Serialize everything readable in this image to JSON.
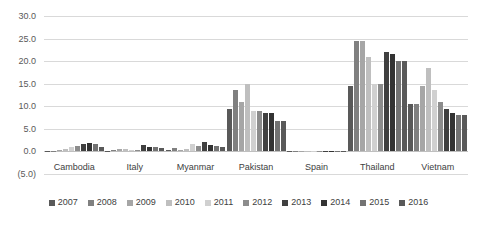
{
  "chart_data": {
    "type": "bar",
    "title": "",
    "subtitle": "",
    "xlabel": "",
    "ylabel": "",
    "ylim": [
      -5.0,
      30.0
    ],
    "ytick_step": 5.0,
    "ytick_labels": [
      "30.0",
      "25.0",
      "20.0",
      "15.0",
      "10.0",
      "5.0",
      "0.0",
      "(5.0)"
    ],
    "ytick_values": [
      30.0,
      25.0,
      20.0,
      15.0,
      10.0,
      5.0,
      0.0,
      -5.0
    ],
    "grid": true,
    "legend_position": "bottom",
    "categories": [
      "Cambodia",
      "Italy",
      "Myanmar",
      "Pakistan",
      "Spain",
      "Thailand",
      "Vietnam"
    ],
    "series": [
      {
        "name": "2007",
        "color": "#595959",
        "values": [
          0.1,
          0.2,
          0.3,
          9.5,
          0.05,
          14.5,
          10.5
        ]
      },
      {
        "name": "2008",
        "color": "#808080",
        "values": [
          0.2,
          0.3,
          0.8,
          13.5,
          0.05,
          24.5,
          10.5
        ]
      },
      {
        "name": "2009",
        "color": "#a6a6a6",
        "values": [
          0.4,
          0.6,
          0.4,
          11.0,
          0.05,
          24.5,
          14.5
        ]
      },
      {
        "name": "2010",
        "color": "#bfbfbf",
        "values": [
          0.6,
          0.5,
          0.5,
          15.0,
          0.05,
          21.0,
          18.5
        ]
      },
      {
        "name": "2011",
        "color": "#d0d0d0",
        "values": [
          1.0,
          0.4,
          1.6,
          9.0,
          0.05,
          15.0,
          13.5
        ]
      },
      {
        "name": "2012",
        "color": "#8c8c8c",
        "values": [
          1.3,
          0.3,
          1.2,
          9.0,
          0.05,
          15.0,
          11.0
        ]
      },
      {
        "name": "2013",
        "color": "#404040",
        "values": [
          1.6,
          1.4,
          2.0,
          8.5,
          0.05,
          22.0,
          9.5
        ]
      },
      {
        "name": "2014",
        "color": "#333333",
        "values": [
          1.9,
          1.0,
          1.5,
          8.5,
          0.05,
          21.5,
          8.5
        ]
      },
      {
        "name": "2015",
        "color": "#737373",
        "values": [
          1.7,
          0.9,
          1.3,
          6.8,
          0.05,
          20.0,
          8.0
        ]
      },
      {
        "name": "2016",
        "color": "#595959",
        "values": [
          0.9,
          0.7,
          0.9,
          6.8,
          0.05,
          20.0,
          8.0
        ]
      }
    ]
  }
}
